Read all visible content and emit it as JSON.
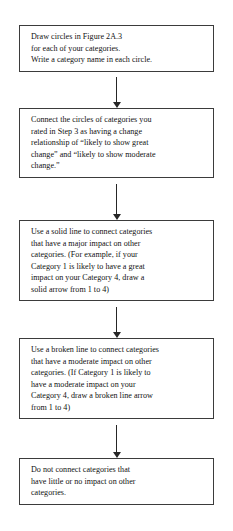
{
  "diagram": {
    "type": "flowchart",
    "orientation": "vertical",
    "background_color": "#ffffff",
    "box_border_color": "#3b3b3b",
    "text_color": "#111111",
    "arrow_color": "#262626",
    "steps": [
      {
        "id": "step-draw-circles",
        "lines": [
          "Draw circles in Figure 2A.3",
          "for each of your categories.",
          "Write a category name in each circle."
        ]
      },
      {
        "id": "step-connect-change-relationship",
        "lines": [
          "Connect the circles of categories you",
          "rated in Step 3 as having a change",
          "relationship of “likely to show great",
          "change” and “likely to show moderate",
          "change.”"
        ]
      },
      {
        "id": "step-solid-line-major-impact",
        "lines": [
          "Use a solid line to connect categories",
          "that have a major impact on other",
          "categories. (For example, if your",
          "Category 1 is likely to have a great",
          "impact on your Category 4, draw a",
          "solid arrow from 1 to 4)"
        ]
      },
      {
        "id": "step-broken-line-moderate-impact",
        "lines": [
          "Use a broken line to connect categories",
          "that have a moderate impact on other",
          "categories. (If Category 1 is likely to",
          "have a moderate impact on your",
          "Category 4, draw a broken line arrow",
          "from 1 to 4)"
        ]
      },
      {
        "id": "step-do-not-connect-little-impact",
        "lines": [
          "Do not connect categories that",
          "have little or no impact on other",
          "categories."
        ]
      }
    ],
    "connectors": [
      {
        "id": "connector-1-to-2",
        "from": "step-draw-circles",
        "to": "step-connect-change-relationship"
      },
      {
        "id": "connector-2-to-3",
        "from": "step-connect-change-relationship",
        "to": "step-solid-line-major-impact"
      },
      {
        "id": "connector-3-to-4",
        "from": "step-solid-line-major-impact",
        "to": "step-broken-line-moderate-impact"
      },
      {
        "id": "connector-4-to-5",
        "from": "step-broken-line-moderate-impact",
        "to": "step-do-not-connect-little-impact"
      }
    ]
  }
}
